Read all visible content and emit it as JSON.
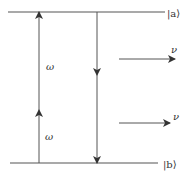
{
  "diagram": {
    "levels": [
      {
        "id": "upper",
        "label": "|a⟩",
        "y": 12
      },
      {
        "id": "lower",
        "label": "|b⟩",
        "y": 163
      }
    ],
    "transitions": [
      {
        "id": "absorption",
        "direction": "up",
        "label_upper": "ω",
        "label_lower": "ω"
      },
      {
        "id": "emission",
        "direction": "down"
      }
    ],
    "emitted_photons": [
      {
        "id": "photon-1",
        "label": "ν"
      },
      {
        "id": "photon-2",
        "label": "ν"
      }
    ],
    "colors": {
      "line": "#555555",
      "text": "#333333",
      "background": "#ffffff"
    }
  }
}
